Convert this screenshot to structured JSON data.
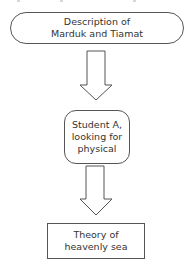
{
  "diagram": {
    "type": "flowchart",
    "nodes": [
      {
        "id": "n1",
        "shape": "terminal",
        "label": "Description of\nMarduk and Tiamat"
      },
      {
        "id": "n2",
        "shape": "rounded-rectangle",
        "label": "Student A,\nlooking for\nphysical"
      },
      {
        "id": "n3",
        "shape": "rectangle",
        "label": "Theory of\nheavenly sea"
      }
    ],
    "edges": [
      {
        "from": "n1",
        "to": "n2",
        "style": "block-arrow-down"
      },
      {
        "from": "n2",
        "to": "n3",
        "style": "block-arrow-down"
      }
    ],
    "colors": {
      "stroke": "#555555",
      "text": "#333333",
      "background": "#ffffff"
    }
  }
}
